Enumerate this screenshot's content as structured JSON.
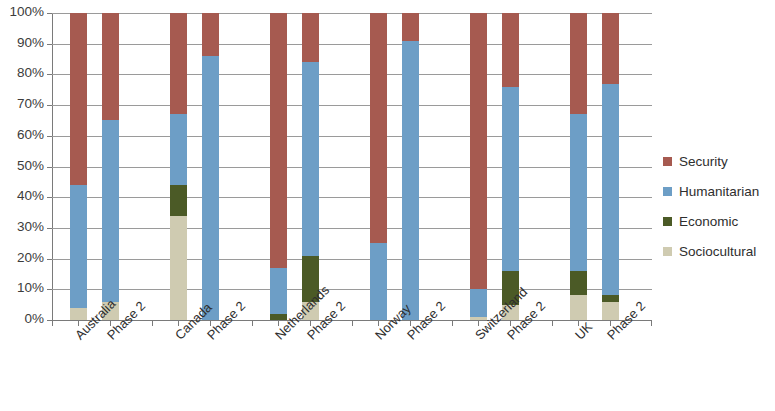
{
  "chart_data": {
    "type": "bar",
    "stacked": true,
    "stack_mode": "percent",
    "title": "",
    "xlabel": "",
    "ylabel": "",
    "ylim": [
      0,
      100
    ],
    "ytick_labels": [
      "100%",
      "90%",
      "80%",
      "70%",
      "60%",
      "50%",
      "40%",
      "30%",
      "20%",
      "10%",
      "0%"
    ],
    "ytick_values": [
      100,
      90,
      80,
      70,
      60,
      50,
      40,
      30,
      20,
      10,
      0
    ],
    "grid": true,
    "legend_position": "right",
    "groups": [
      "Australia",
      "Canada",
      "Netherlands",
      "Norway",
      "Switzerland",
      "UK"
    ],
    "categories": [
      "Australia",
      "Phase 2",
      "Canada",
      "Phase 2",
      "Netherlands",
      "Phase 2",
      "Norway",
      "Phase 2",
      "Switzerland",
      "Phase 2",
      "UK",
      "Phase 2"
    ],
    "series": [
      {
        "name": "Sociocultural",
        "color": "#cfcbb1",
        "values": [
          4,
          6,
          34,
          0,
          0,
          6,
          0,
          0,
          1,
          5,
          8,
          6
        ]
      },
      {
        "name": "Economic",
        "color": "#4b5a26",
        "values": [
          0,
          0,
          10,
          0,
          2,
          15,
          0,
          0,
          0,
          11,
          8,
          2
        ]
      },
      {
        "name": "Humanitarian",
        "color": "#6d9ec6",
        "values": [
          40,
          59,
          23,
          86,
          15,
          63,
          25,
          91,
          9,
          60,
          51,
          69
        ]
      },
      {
        "name": "Security",
        "color": "#a65a50",
        "values": [
          56,
          35,
          33,
          14,
          83,
          16,
          75,
          9,
          90,
          24,
          33,
          23
        ]
      }
    ],
    "cumulative_tops": {
      "note": "stack tops in percent, bottom-to-top order [sociocultural, economic, humanitarian, security]",
      "bars": [
        {
          "label": "Australia",
          "tops": [
            4,
            4,
            44,
            100
          ]
        },
        {
          "label": "Phase 2",
          "tops": [
            6,
            6,
            65,
            100
          ]
        },
        {
          "label": "Canada",
          "tops": [
            34,
            44,
            67,
            100
          ]
        },
        {
          "label": "Phase 2",
          "tops": [
            0,
            0,
            86,
            100
          ]
        },
        {
          "label": "Netherlands",
          "tops": [
            0,
            2,
            17,
            100
          ]
        },
        {
          "label": "Phase 2",
          "tops": [
            6,
            21,
            84,
            100
          ]
        },
        {
          "label": "Norway",
          "tops": [
            0,
            0,
            25,
            100
          ]
        },
        {
          "label": "Phase 2",
          "tops": [
            0,
            0,
            91,
            100
          ]
        },
        {
          "label": "Switzerland",
          "tops": [
            1,
            1,
            10,
            100
          ]
        },
        {
          "label": "Phase 2",
          "tops": [
            5,
            16,
            76,
            100
          ]
        },
        {
          "label": "UK",
          "tops": [
            8,
            16,
            67,
            100
          ]
        },
        {
          "label": "Phase 2",
          "tops": [
            6,
            8,
            77,
            100
          ]
        }
      ]
    }
  },
  "legend": {
    "items": [
      {
        "label": "Security",
        "color": "#a65a50"
      },
      {
        "label": "Humanitarian",
        "color": "#6d9ec6"
      },
      {
        "label": "Economic",
        "color": "#4b5a26"
      },
      {
        "label": "Sociocultural",
        "color": "#cfcbb1"
      }
    ]
  }
}
